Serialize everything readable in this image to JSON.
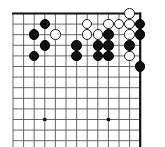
{
  "figure": {
    "title": "Go board diagram",
    "description": "Partial go board showing the top-right corner area with black and white stones",
    "board": {
      "columns": 13,
      "rows": 13,
      "origin_x": 13,
      "origin_y": 13.5,
      "spacing": 10.6,
      "line_color": "#555555",
      "edge_color": "#111111",
      "edge_width": 2.2,
      "line_width": 0.9,
      "background_color": "#ffffff",
      "top_edge": true,
      "right_edge": true,
      "bottom_edge": false,
      "left_edge": false
    },
    "star_points": [
      {
        "col": 3,
        "row": 10
      },
      {
        "col": 9,
        "row": 10
      }
    ],
    "star_point_size": 3.2,
    "stone_radius": 5.3,
    "colors": {
      "black": "#111111",
      "white": "#ffffff",
      "white_outline": "#1a1a1a"
    },
    "stones": [
      {
        "color": "black",
        "col": 3,
        "row": 1
      },
      {
        "color": "black",
        "col": 2,
        "row": 2
      },
      {
        "color": "black",
        "col": 3,
        "row": 3
      },
      {
        "color": "black",
        "col": 2,
        "row": 4
      },
      {
        "color": "black",
        "col": 6,
        "row": 3
      },
      {
        "color": "black",
        "col": 6,
        "row": 4
      },
      {
        "color": "black",
        "col": 9,
        "row": 2
      },
      {
        "color": "black",
        "col": 8,
        "row": 3
      },
      {
        "color": "black",
        "col": 9,
        "row": 3
      },
      {
        "color": "black",
        "col": 8,
        "row": 4
      },
      {
        "color": "black",
        "col": 9,
        "row": 4
      },
      {
        "color": "black",
        "col": 12,
        "row": 1
      },
      {
        "color": "black",
        "col": 12,
        "row": 2
      },
      {
        "color": "black",
        "col": 11,
        "row": 3
      },
      {
        "color": "black",
        "col": 12,
        "row": 5
      },
      {
        "color": "white",
        "col": 4,
        "row": 2
      },
      {
        "color": "white",
        "col": 7,
        "row": 1
      },
      {
        "color": "white",
        "col": 7,
        "row": 2
      },
      {
        "color": "white",
        "col": 8,
        "row": 2
      },
      {
        "color": "white",
        "col": 9,
        "row": 1
      },
      {
        "color": "white",
        "col": 10,
        "row": 1
      },
      {
        "color": "white",
        "col": 11,
        "row": 0
      },
      {
        "color": "white",
        "col": 11,
        "row": 1
      },
      {
        "color": "white",
        "col": 11,
        "row": 2
      },
      {
        "color": "white",
        "col": 11,
        "row": 4
      }
    ]
  }
}
